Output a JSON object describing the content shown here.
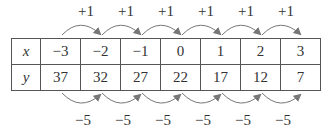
{
  "table": {
    "rows": [
      {
        "header": "x",
        "values": [
          "−3",
          "−2",
          "−1",
          "0",
          "1",
          "2",
          "3"
        ]
      },
      {
        "header": "y",
        "values": [
          "37",
          "32",
          "27",
          "22",
          "17",
          "12",
          "7"
        ]
      }
    ]
  },
  "top_arrows": {
    "labels": [
      "+1",
      "+1",
      "+1",
      "+1",
      "+1",
      "+1"
    ]
  },
  "bottom_arrows": {
    "labels": [
      "−5",
      "−5",
      "−5",
      "−5",
      "−5",
      "−5"
    ]
  }
}
